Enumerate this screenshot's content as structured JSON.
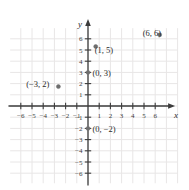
{
  "chart_data": {
    "type": "scatter",
    "title": "",
    "xlabel": "x",
    "ylabel": "y",
    "xlim": [
      -6.5,
      6.6
    ],
    "ylim": [
      -6.6,
      6.6
    ],
    "grid": true,
    "legend": false,
    "xticks": [
      -6,
      -5,
      -4,
      -3,
      -2,
      -1,
      1,
      2,
      3,
      4,
      5,
      6
    ],
    "yticks": [
      6,
      5,
      4,
      3,
      2,
      1,
      -1,
      -2,
      -3,
      -4,
      -5,
      -6
    ],
    "xtick_labels": [
      "-6",
      "-5",
      "-4",
      "-3",
      "-2",
      "-1",
      "1",
      "2",
      "3",
      "4",
      "5",
      "6"
    ],
    "ytick_labels": [
      "6",
      "5",
      "4",
      "3",
      "2",
      "1",
      "-1",
      "-2",
      "-3",
      "-4",
      "-5",
      "-6"
    ],
    "points": [
      {
        "x": -3,
        "y": 2,
        "label": "(−3, 2)",
        "label_position": "left"
      },
      {
        "x": 0,
        "y": 3,
        "label": "(0, 3)",
        "label_position": "right"
      },
      {
        "x": 1,
        "y": 5,
        "label": "(1, 5)",
        "label_position": "right-below"
      },
      {
        "x": 6,
        "y": 6,
        "label": "(6, 6)",
        "label_position": "left-below"
      },
      {
        "x": 0,
        "y": -2,
        "label": "(0, −2)",
        "label_position": "right"
      }
    ]
  },
  "axes": {
    "x_axis_name": "x",
    "y_axis_name": "y"
  },
  "colors": {
    "grid": "#e8e6e6",
    "axis": "#3c3c3c",
    "point": "#6e6e6e",
    "text": "#2b2b2b",
    "background": "#ffffff"
  }
}
